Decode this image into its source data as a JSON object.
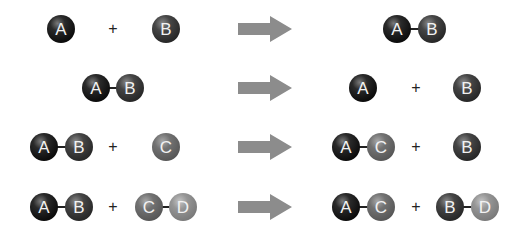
{
  "diagram": {
    "type": "chemical reaction types (molecule combination / decomposition / displacement)",
    "colors": {
      "A": "#161616",
      "B": "#3a3a3a",
      "C": "#6a6a6a",
      "D": "#8a8a8a",
      "arrow": "#8c8c8c"
    },
    "plus_sign": "+",
    "rows": [
      {
        "reactants": [
          "A",
          "B"
        ],
        "products": [
          "A-B"
        ],
        "labels": {
          "r1": "A",
          "r2": "B",
          "p1a": "A",
          "p1b": "B"
        }
      },
      {
        "reactants": [
          "A-B"
        ],
        "products": [
          "A",
          "B"
        ],
        "labels": {
          "r1a": "A",
          "r1b": "B",
          "p1": "A",
          "p2": "B"
        }
      },
      {
        "reactants": [
          "A-B",
          "C"
        ],
        "products": [
          "A-C",
          "B"
        ],
        "labels": {
          "r1a": "A",
          "r1b": "B",
          "r2": "C",
          "p1a": "A",
          "p1b": "C",
          "p2": "B"
        }
      },
      {
        "reactants": [
          "A-B",
          "C-D"
        ],
        "products": [
          "A-C",
          "B-D"
        ],
        "labels": {
          "r1a": "A",
          "r1b": "B",
          "r2a": "C",
          "r2b": "D",
          "p1a": "A",
          "p1b": "C",
          "p2a": "B",
          "p2b": "D"
        }
      }
    ]
  }
}
